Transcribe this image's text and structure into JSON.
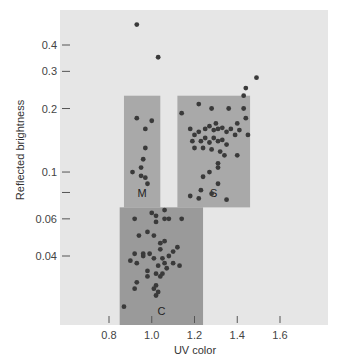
{
  "chart_data": {
    "type": "scatter",
    "title": "",
    "xlabel": "UV color",
    "ylabel": "Reflected brightness",
    "yscale": "log",
    "xlim": [
      0.5,
      1.77
    ],
    "ylim": [
      0.022,
      0.55
    ],
    "x_ticks": [
      0.8,
      1.0,
      1.2,
      1.4,
      1.6
    ],
    "x_tick_labels": [
      "0.8",
      "1.0",
      "1.2",
      "1.4",
      "1.6"
    ],
    "y_ticks": [
      0.04,
      0.06,
      0.08,
      0.1,
      0.2,
      0.3,
      0.4
    ],
    "y_tick_labels": [
      "0.04",
      "0.06",
      "",
      "0.1",
      "0.2",
      "0.3",
      "0.4"
    ],
    "grid": false,
    "legend": null,
    "colors": {
      "plot_background": "#e6e6e6",
      "region_fill": "#a9a9a9",
      "region_c_fill": "#9a9a9a",
      "point": "#3a3a3a"
    },
    "regions": [
      {
        "label": "M",
        "x_range": [
          0.87,
          1.04
        ],
        "y_range": [
          0.068,
          0.23
        ]
      },
      {
        "label": "S",
        "x_range": [
          1.12,
          1.46
        ],
        "y_range": [
          0.068,
          0.23
        ]
      },
      {
        "label": "C",
        "x_range": [
          0.85,
          1.24
        ],
        "y_range": [
          0.022,
          0.068
        ]
      }
    ],
    "series": [
      {
        "name": "Outliers",
        "points": [
          [
            0.93,
            0.5
          ],
          [
            1.03,
            0.35
          ],
          [
            1.49,
            0.28
          ],
          [
            1.44,
            0.25
          ],
          [
            1.43,
            0.23
          ]
        ]
      },
      {
        "name": "M",
        "points": [
          [
            0.93,
            0.18
          ],
          [
            0.97,
            0.16
          ],
          [
            1.0,
            0.175
          ],
          [
            0.97,
            0.13
          ],
          [
            0.96,
            0.115
          ],
          [
            0.95,
            0.105
          ],
          [
            0.98,
            0.088
          ],
          [
            0.91,
            0.1
          ],
          [
            0.95,
            0.096
          ],
          [
            0.97,
            0.094
          ]
        ]
      },
      {
        "name": "S",
        "points": [
          [
            1.14,
            0.19
          ],
          [
            1.22,
            0.21
          ],
          [
            1.28,
            0.2
          ],
          [
            1.36,
            0.2
          ],
          [
            1.43,
            0.2
          ],
          [
            1.4,
            0.17
          ],
          [
            1.44,
            0.18
          ],
          [
            1.3,
            0.17
          ],
          [
            1.18,
            0.16
          ],
          [
            1.2,
            0.15
          ],
          [
            1.22,
            0.155
          ],
          [
            1.25,
            0.16
          ],
          [
            1.27,
            0.165
          ],
          [
            1.29,
            0.158
          ],
          [
            1.31,
            0.16
          ],
          [
            1.33,
            0.162
          ],
          [
            1.35,
            0.155
          ],
          [
            1.37,
            0.16
          ],
          [
            1.39,
            0.15
          ],
          [
            1.41,
            0.158
          ],
          [
            1.19,
            0.14
          ],
          [
            1.23,
            0.14
          ],
          [
            1.25,
            0.145
          ],
          [
            1.27,
            0.138
          ],
          [
            1.29,
            0.145
          ],
          [
            1.31,
            0.14
          ],
          [
            1.33,
            0.142
          ],
          [
            1.35,
            0.135
          ],
          [
            1.2,
            0.13
          ],
          [
            1.24,
            0.13
          ],
          [
            1.28,
            0.128
          ],
          [
            1.32,
            0.125
          ],
          [
            1.34,
            0.12
          ],
          [
            1.45,
            0.15
          ],
          [
            1.4,
            0.12
          ],
          [
            1.31,
            0.11
          ],
          [
            1.31,
            0.105
          ],
          [
            1.27,
            0.1
          ],
          [
            1.24,
            0.095
          ],
          [
            1.31,
            0.088
          ],
          [
            1.23,
            0.082
          ],
          [
            1.28,
            0.079
          ],
          [
            1.18,
            0.077
          ],
          [
            1.22,
            0.075
          ],
          [
            1.35,
            0.074
          ]
        ]
      },
      {
        "name": "C",
        "points": [
          [
            1.06,
            0.066
          ],
          [
            1.0,
            0.064
          ],
          [
            1.02,
            0.062
          ],
          [
            1.06,
            0.06
          ],
          [
            1.02,
            0.058
          ],
          [
            1.08,
            0.06
          ],
          [
            1.14,
            0.06
          ],
          [
            0.92,
            0.06
          ],
          [
            0.98,
            0.052
          ],
          [
            0.94,
            0.05
          ],
          [
            1.01,
            0.05
          ],
          [
            1.04,
            0.046
          ],
          [
            1.06,
            0.047
          ],
          [
            1.12,
            0.044
          ],
          [
            1.1,
            0.042
          ],
          [
            1.04,
            0.043
          ],
          [
            0.96,
            0.041
          ],
          [
            0.99,
            0.041
          ],
          [
            0.92,
            0.041
          ],
          [
            0.96,
            0.04
          ],
          [
            1.08,
            0.04
          ],
          [
            1.05,
            0.039
          ],
          [
            1.01,
            0.039
          ],
          [
            0.9,
            0.038
          ],
          [
            0.93,
            0.037
          ],
          [
            1.06,
            0.037
          ],
          [
            1.1,
            0.037
          ],
          [
            1.03,
            0.036
          ],
          [
            1.07,
            0.035
          ],
          [
            1.13,
            0.036
          ],
          [
            0.98,
            0.034
          ],
          [
            1.02,
            0.033
          ],
          [
            1.05,
            0.033
          ],
          [
            0.98,
            0.032
          ],
          [
            1.04,
            0.032
          ],
          [
            0.93,
            0.03
          ],
          [
            1.02,
            0.029
          ],
          [
            0.92,
            0.028
          ],
          [
            1.01,
            0.028
          ],
          [
            1.03,
            0.027
          ],
          [
            1.02,
            0.026
          ],
          [
            0.87,
            0.023
          ]
        ]
      }
    ]
  },
  "axes": {
    "xlabel": "UV color",
    "ylabel": "Reflected brightness"
  }
}
